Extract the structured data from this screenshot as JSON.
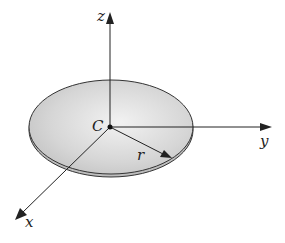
{
  "diagram": {
    "type": "3d-coordinate-system-with-disc",
    "labels": {
      "z_axis": "z",
      "y_axis": "y",
      "x_axis": "x",
      "center": "C",
      "radius": "r"
    },
    "colors": {
      "disc_fill": "#cfcfcf",
      "disc_edge": "#333333",
      "axis": "#222222",
      "background": "#ffffff"
    }
  }
}
